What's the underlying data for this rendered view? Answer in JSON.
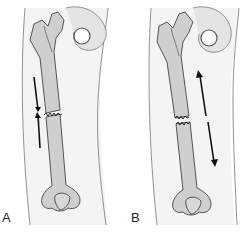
{
  "figure": {
    "panels": [
      {
        "label": "A",
        "description": "Femoral shaft fracture with compressive forces (arrows pointing toward fracture)",
        "arrow_type": "compression"
      },
      {
        "label": "B",
        "description": "Femoral shaft fracture with distraction forces (arrows pointing away from fracture)",
        "arrow_type": "distraction"
      }
    ],
    "colors": {
      "bone_fill": "#cfcfcf",
      "bone_outline": "#444444",
      "soft_tissue_fill": "#f4f4f4",
      "soft_tissue_outline": "#666666",
      "arrow": "#111111",
      "background": "#ffffff"
    }
  }
}
